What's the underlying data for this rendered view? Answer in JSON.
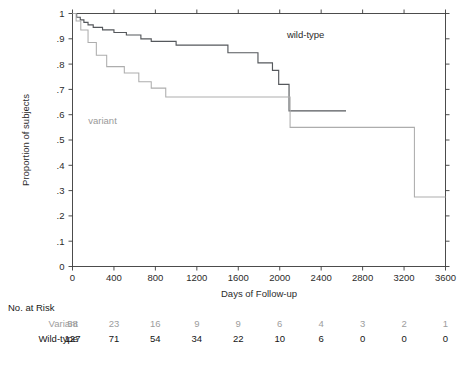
{
  "chart_data": {
    "type": "line",
    "subtype": "kaplan-meier-step",
    "title": "",
    "xlabel": "Days of Follow-up",
    "ylabel": "Proportion of subjects",
    "xlim": [
      0,
      3600
    ],
    "ylim": [
      0,
      1
    ],
    "grid": false,
    "legend_position": "inline-annotations",
    "xticks": [
      0,
      400,
      800,
      1200,
      1600,
      2000,
      2400,
      2800,
      3200,
      3600
    ],
    "xtick_labels": [
      "0",
      "400",
      "800",
      "1200",
      "1600",
      "2000",
      "2400",
      "2800",
      "3200",
      "3600"
    ],
    "yticks": [
      0,
      0.1,
      0.2,
      0.3,
      0.4,
      0.5,
      0.6,
      0.7,
      0.8,
      0.9,
      1
    ],
    "ytick_labels": [
      "0",
      ".1",
      ".2",
      ".3",
      ".4",
      ".5",
      ".6",
      ".7",
      ".8",
      ".9",
      "1"
    ],
    "series": [
      {
        "name": "wild-type",
        "color": "#55585c",
        "annotation": "wild-type",
        "annotation_x": 2250,
        "annotation_y": 0.905,
        "x": [
          0,
          20,
          40,
          60,
          75,
          95,
          110,
          130,
          150,
          175,
          200,
          240,
          290,
          340,
          400,
          460,
          520,
          600,
          660,
          700,
          760,
          820,
          1000,
          1480,
          1500,
          1760,
          1790,
          1900,
          1930,
          1960,
          1990,
          2060,
          2090,
          2640
        ],
        "y": [
          1.0,
          1.0,
          0.985,
          0.985,
          0.975,
          0.975,
          0.965,
          0.965,
          0.955,
          0.955,
          0.945,
          0.945,
          0.935,
          0.935,
          0.925,
          0.925,
          0.915,
          0.915,
          0.9,
          0.9,
          0.89,
          0.89,
          0.875,
          0.875,
          0.845,
          0.845,
          0.805,
          0.805,
          0.775,
          0.775,
          0.72,
          0.72,
          0.615,
          0.615
        ]
      },
      {
        "name": "variant",
        "color": "#adadad",
        "annotation": "variant",
        "annotation_x": 290,
        "annotation_y": 0.565,
        "x": [
          0,
          15,
          35,
          55,
          80,
          110,
          150,
          190,
          230,
          270,
          330,
          420,
          500,
          560,
          640,
          700,
          760,
          830,
          900,
          1000,
          1200,
          1500,
          1800,
          2050,
          2100,
          3270,
          3300,
          3600
        ],
        "y": [
          1.0,
          1.0,
          0.97,
          0.97,
          0.935,
          0.935,
          0.885,
          0.885,
          0.835,
          0.835,
          0.79,
          0.79,
          0.765,
          0.765,
          0.73,
          0.73,
          0.705,
          0.705,
          0.67,
          0.67,
          0.67,
          0.67,
          0.67,
          0.67,
          0.55,
          0.55,
          0.275,
          0.275
        ]
      }
    ]
  },
  "risk_table": {
    "title": "No. at Risk",
    "times": [
      0,
      400,
      800,
      1200,
      1600,
      2000,
      2400,
      2800,
      3200,
      3600
    ],
    "rows": [
      {
        "label": "Variant",
        "color": "#9d9d9d",
        "counts": [
          "58",
          "23",
          "16",
          "9",
          "9",
          "6",
          "4",
          "3",
          "2",
          "1"
        ]
      },
      {
        "label": "Wild-type",
        "color": "#151515",
        "counts": [
          "127",
          "71",
          "54",
          "34",
          "22",
          "10",
          "6",
          "0",
          "0",
          "0"
        ]
      }
    ]
  }
}
